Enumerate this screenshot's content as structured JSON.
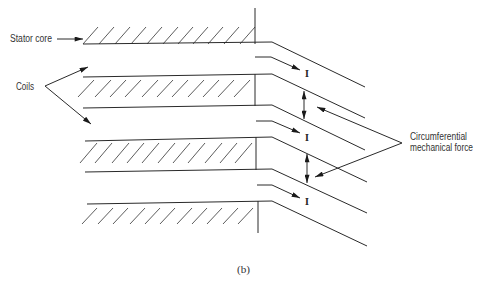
{
  "figure": {
    "caption": "(b)",
    "labels": {
      "stator_core": "Stator core",
      "coils": "Coils",
      "force_line1": "Circumferential",
      "force_line2": "mechanical force"
    },
    "current_labels": [
      "I",
      "I",
      "I"
    ],
    "colors": {
      "line": "#2a2a2a",
      "hatch": "#4a4a4a",
      "text": "#333333",
      "background": "#ffffff"
    }
  }
}
